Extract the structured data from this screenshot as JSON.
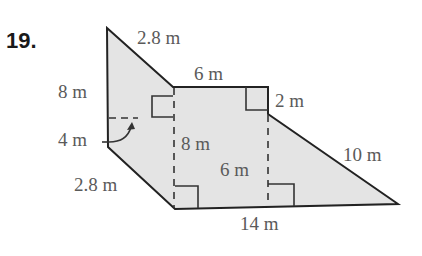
{
  "problem": {
    "number": "19."
  },
  "figure": {
    "fill_color": "#e4e4e4",
    "stroke_color": "#222222",
    "text_color": "#5a5a5a",
    "labels": {
      "top_slant": "2.8 m",
      "top": "6 m",
      "right_step": "2 m",
      "right_slant": "10 m",
      "left_height": "8 m",
      "left_small": "4 m",
      "bottom_left_slant": "2.8 m",
      "inner_left_height": "8 m",
      "inner_right_height": "6 m",
      "bottom": "14 m"
    }
  }
}
